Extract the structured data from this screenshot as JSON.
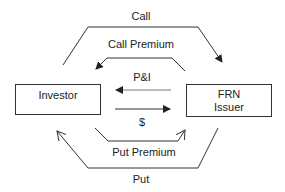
{
  "diagram": {
    "nodes": {
      "investor": {
        "label": "Investor"
      },
      "issuer": {
        "line1": "FRN",
        "line2": "Issuer"
      }
    },
    "flows": {
      "call": {
        "label": "Call",
        "from": "Investor",
        "to": "FRN Issuer"
      },
      "call_premium": {
        "label": "Call Premium",
        "from": "FRN Issuer",
        "to": "Investor"
      },
      "pi": {
        "label": "P&I",
        "from": "FRN Issuer",
        "to": "Investor"
      },
      "dollar": {
        "label": "$",
        "from": "Investor",
        "to": "FRN Issuer"
      },
      "put_premium": {
        "label": "Put Premium",
        "from": "Investor",
        "to": "FRN Issuer"
      },
      "put": {
        "label": "Put",
        "from": "FRN Issuer",
        "to": "Investor"
      }
    },
    "colors": {
      "line": "#333333",
      "text": "#222222",
      "background": "#ffffff"
    }
  }
}
